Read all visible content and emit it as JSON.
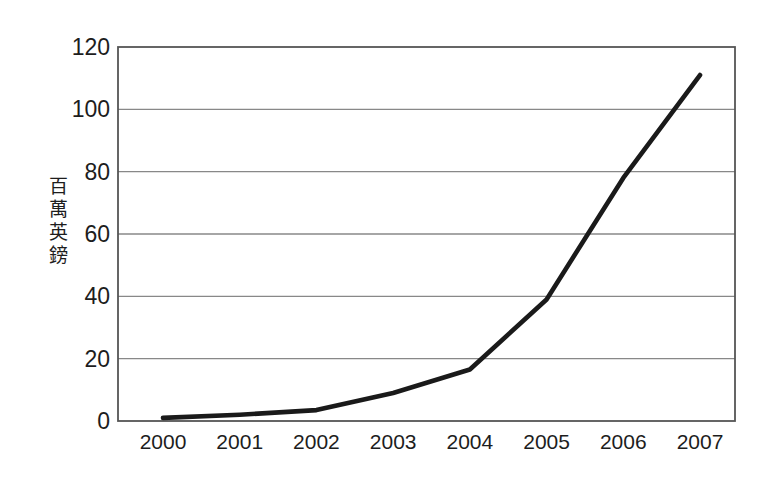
{
  "chart_data": {
    "type": "line",
    "title": "",
    "subtitle": "",
    "xlabel": "",
    "ylabel": "百萬英鎊",
    "categories": [
      "2000",
      "2001",
      "2002",
      "2003",
      "2004",
      "2005",
      "2006",
      "2007"
    ],
    "x": [
      2000,
      2001,
      2002,
      2003,
      2004,
      2005,
      2006,
      2007
    ],
    "values": [
      1,
      2,
      3.5,
      9,
      16.5,
      39,
      78,
      111
    ],
    "series": [
      {
        "name": "",
        "values": [
          1,
          2,
          3.5,
          9,
          16.5,
          39,
          78,
          111
        ]
      }
    ],
    "ylim": [
      0,
      120
    ],
    "y_ticks": [
      0,
      20,
      40,
      60,
      80,
      100,
      120
    ],
    "y_tick_labels": [
      "0",
      "20",
      "40",
      "60",
      "80",
      "100",
      "120"
    ],
    "grid": "horizontal",
    "legend": "none",
    "line_color": "#1a1a1a",
    "grid_color": "#888888",
    "axis_color": "#555555",
    "background_color": "#ffffff",
    "annotations": []
  },
  "axis": {
    "y_title_chars": [
      "百",
      "萬",
      "英",
      "鎊"
    ]
  }
}
